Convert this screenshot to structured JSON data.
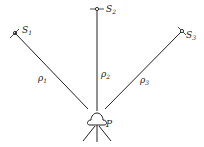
{
  "diagram": {
    "satellites": [
      {
        "name": "S",
        "sub": "1"
      },
      {
        "name": "S",
        "sub": "2"
      },
      {
        "name": "S",
        "sub": "3"
      }
    ],
    "ranges": [
      {
        "name": "ρ",
        "sub": "1"
      },
      {
        "name": "ρ",
        "sub": "2"
      },
      {
        "name": "ρ",
        "sub": "3"
      }
    ],
    "receiver": {
      "label": "P"
    },
    "colors": {
      "line": "#222222",
      "background": "#ffffff"
    }
  }
}
